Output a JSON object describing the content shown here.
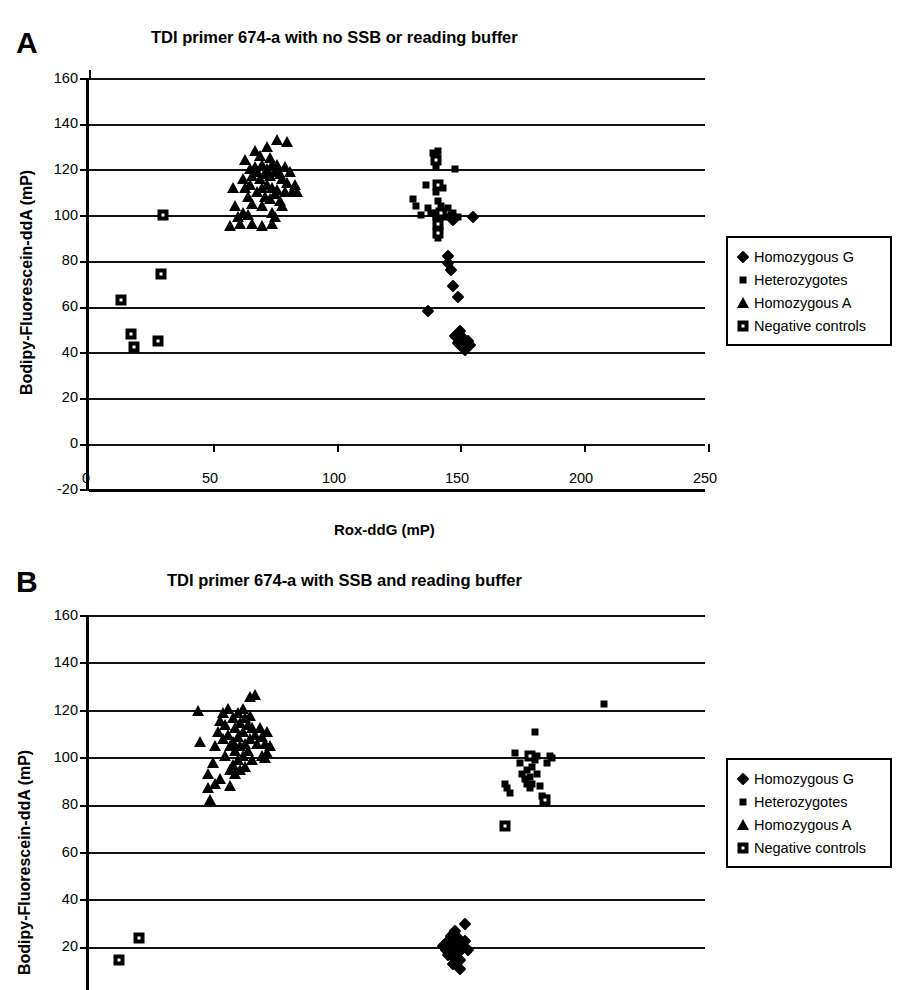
{
  "figure": {
    "panels": [
      {
        "letter": "A",
        "title": "TDI primer 674-a with no SSB or reading buffer",
        "xlabel": "Rox-ddG (mP)",
        "ylabel": "Bodipy-Fluorescein-ddA (mP)",
        "yticks": [
          "160",
          "140",
          "120",
          "100",
          "80",
          "60",
          "40",
          "20",
          "0",
          "-20"
        ],
        "xticks": [
          "0",
          "50",
          "100",
          "150",
          "200",
          "250"
        ]
      },
      {
        "letter": "B",
        "title": "TDI primer 674-a with SSB and reading buffer",
        "xlabel": "",
        "ylabel": "Bodipy-Fluorescein-ddA (mP)",
        "yticks": [
          "160",
          "140",
          "120",
          "100",
          "80",
          "60",
          "40",
          "20"
        ],
        "xticks": []
      }
    ],
    "legend": {
      "items": [
        {
          "label": "Homozygous G",
          "symbol": "diamond-marker"
        },
        {
          "label": "Heterozygotes",
          "symbol": "small-square-marker"
        },
        {
          "label": "Homozygous A",
          "symbol": "triangle-marker"
        },
        {
          "label": "Negative controls",
          "symbol": "dotted-square-marker"
        }
      ]
    },
    "colors": {
      "ink": "#000000",
      "background": "#ffffff"
    }
  },
  "chart_data": [
    {
      "type": "scatter",
      "panel": "A",
      "title": "TDI primer 674-a with no SSB or reading buffer",
      "xlabel": "Rox-ddG (mP)",
      "ylabel": "Bodipy-Fluorescein-ddA (mP)",
      "xlim": [
        0,
        250
      ],
      "ylim": [
        -20,
        160
      ],
      "grid": true,
      "legend_position": "right",
      "series": [
        {
          "name": "Homozygous A",
          "marker": "triangle",
          "points": [
            [
              59,
              104
            ],
            [
              60,
              99
            ],
            [
              61,
              96
            ],
            [
              62,
              116
            ],
            [
              63,
              112
            ],
            [
              63,
              124
            ],
            [
              64,
              108
            ],
            [
              64,
              100
            ],
            [
              65,
              120
            ],
            [
              65,
              113
            ],
            [
              66,
              117
            ],
            [
              66,
              105
            ],
            [
              67,
              128
            ],
            [
              67,
              121
            ],
            [
              68,
              119
            ],
            [
              68,
              110
            ],
            [
              69,
              126
            ],
            [
              69,
              116
            ],
            [
              70,
              122
            ],
            [
              70,
              112
            ],
            [
              70,
              104
            ],
            [
              71,
              118
            ],
            [
              71,
              108
            ],
            [
              72,
              130
            ],
            [
              72,
              120
            ],
            [
              72,
              113
            ],
            [
              73,
              125
            ],
            [
              73,
              117
            ],
            [
              73,
              107
            ],
            [
              74,
              122
            ],
            [
              74,
              112
            ],
            [
              74,
              101
            ],
            [
              75,
              119
            ],
            [
              75,
              109
            ],
            [
              75,
              99
            ],
            [
              76,
              133
            ],
            [
              76,
              122
            ],
            [
              76,
              111
            ],
            [
              77,
              118
            ],
            [
              77,
              106
            ],
            [
              78,
              116
            ],
            [
              78,
              104
            ],
            [
              79,
              121
            ],
            [
              79,
              110
            ],
            [
              80,
              132
            ],
            [
              80,
              114
            ],
            [
              81,
              119
            ],
            [
              82,
              110
            ],
            [
              83,
              113
            ],
            [
              84,
              110
            ],
            [
              57,
              95
            ],
            [
              58,
              112
            ],
            [
              62,
              101
            ],
            [
              66,
              96
            ],
            [
              70,
              95
            ],
            [
              74,
              96
            ]
          ]
        },
        {
          "name": "Heterozygotes",
          "marker": "small-square",
          "points": [
            [
              131,
              107
            ],
            [
              132,
              104
            ],
            [
              134,
              100
            ],
            [
              136,
              113
            ],
            [
              137,
              103
            ],
            [
              138,
              101
            ],
            [
              139,
              127
            ],
            [
              140,
              126
            ],
            [
              140,
              121
            ],
            [
              140,
              110
            ],
            [
              140,
              100
            ],
            [
              141,
              128
            ],
            [
              141,
              106
            ],
            [
              141,
              97
            ],
            [
              142,
              104
            ],
            [
              142,
              100
            ],
            [
              143,
              112
            ],
            [
              143,
              101
            ],
            [
              144,
              99
            ],
            [
              145,
              103
            ],
            [
              146,
              100
            ],
            [
              147,
              101
            ],
            [
              148,
              120
            ],
            [
              149,
              99
            ],
            [
              141,
              94
            ],
            [
              141,
              90
            ]
          ]
        },
        {
          "name": "Homozygous G",
          "marker": "diamond",
          "points": [
            [
              137,
              58
            ],
            [
              145,
              82
            ],
            [
              145,
              79
            ],
            [
              146,
              76
            ],
            [
              147,
              69
            ],
            [
              149,
              64
            ],
            [
              148,
              47
            ],
            [
              149,
              44
            ],
            [
              150,
              49
            ],
            [
              150,
              43
            ],
            [
              151,
              46
            ],
            [
              152,
              41
            ],
            [
              153,
              45
            ],
            [
              154,
              43
            ],
            [
              155,
              99
            ],
            [
              147,
              98
            ]
          ]
        },
        {
          "name": "Negative controls",
          "marker": "dotted-square",
          "points": [
            [
              13,
              63
            ],
            [
              17,
              48
            ],
            [
              18,
              42
            ],
            [
              28,
              45
            ],
            [
              29,
              74
            ],
            [
              30,
              100
            ],
            [
              140,
              124
            ],
            [
              141,
              113
            ],
            [
              141,
              100
            ],
            [
              141,
              96
            ],
            [
              141,
              92
            ],
            [
              142,
              101
            ]
          ]
        }
      ]
    },
    {
      "type": "scatter",
      "panel": "B",
      "title": "TDI primer 674-a with SSB and reading buffer",
      "xlabel": "",
      "ylabel": "Bodipy-Fluorescein-ddA (mP)",
      "xlim": [
        0,
        250
      ],
      "ylim": [
        0,
        160
      ],
      "grid": true,
      "legend_position": "right",
      "note": "lower portion of plot is cropped by image edge",
      "series": [
        {
          "name": "Homozygous A",
          "marker": "triangle",
          "points": [
            [
              44,
              119
            ],
            [
              45,
              106
            ],
            [
              48,
              92
            ],
            [
              48,
              86
            ],
            [
              49,
              81
            ],
            [
              50,
              97
            ],
            [
              51,
              104
            ],
            [
              52,
              110
            ],
            [
              53,
              115
            ],
            [
              54,
              118
            ],
            [
              54,
              107
            ],
            [
              55,
              113
            ],
            [
              55,
              100
            ],
            [
              56,
              120
            ],
            [
              56,
              109
            ],
            [
              57,
              104
            ],
            [
              57,
              94
            ],
            [
              58,
              116
            ],
            [
              58,
              106
            ],
            [
              58,
              96
            ],
            [
              59,
              112
            ],
            [
              59,
              102
            ],
            [
              59,
              92
            ],
            [
              60,
              118
            ],
            [
              60,
              108
            ],
            [
              60,
              98
            ],
            [
              61,
              114
            ],
            [
              61,
              104
            ],
            [
              61,
              94
            ],
            [
              62,
              120
            ],
            [
              62,
              110
            ],
            [
              62,
              100
            ],
            [
              63,
              116
            ],
            [
              63,
              105
            ],
            [
              63,
              95
            ],
            [
              64,
              113
            ],
            [
              64,
              102
            ],
            [
              65,
              125
            ],
            [
              65,
              117
            ],
            [
              65,
              107
            ],
            [
              66,
              112
            ],
            [
              66,
              98
            ],
            [
              67,
              126
            ],
            [
              67,
              109
            ],
            [
              68,
              105
            ],
            [
              69,
              112
            ],
            [
              70,
              108
            ],
            [
              70,
              100
            ],
            [
              71,
              105
            ],
            [
              71,
              99
            ],
            [
              72,
              110
            ],
            [
              72,
              101
            ],
            [
              73,
              104
            ],
            [
              51,
              88
            ],
            [
              53,
              90
            ],
            [
              57,
              87
            ]
          ]
        },
        {
          "name": "Heterozygotes",
          "marker": "small-square",
          "points": [
            [
              172,
              101
            ],
            [
              174,
              97
            ],
            [
              175,
              92
            ],
            [
              176,
              90
            ],
            [
              177,
              88
            ],
            [
              177,
              94
            ],
            [
              178,
              86
            ],
            [
              178,
              91
            ],
            [
              179,
              95
            ],
            [
              179,
              88
            ],
            [
              180,
              110
            ],
            [
              180,
              98
            ],
            [
              181,
              92
            ],
            [
              182,
              87
            ],
            [
              183,
              83
            ],
            [
              184,
              82
            ],
            [
              185,
              97
            ],
            [
              186,
              100
            ],
            [
              187,
              99
            ],
            [
              168,
              88
            ],
            [
              169,
              86
            ],
            [
              170,
              84
            ],
            [
              181,
              100
            ],
            [
              208,
              122
            ]
          ]
        },
        {
          "name": "Homozygous G",
          "marker": "diamond",
          "points": [
            [
              143,
              19
            ],
            [
              144,
              17
            ],
            [
              145,
              21
            ],
            [
              145,
              15
            ],
            [
              146,
              23
            ],
            [
              146,
              18
            ],
            [
              147,
              20
            ],
            [
              147,
              14
            ],
            [
              148,
              25
            ],
            [
              148,
              19
            ],
            [
              149,
              16
            ],
            [
              149,
              22
            ],
            [
              150,
              20
            ],
            [
              150,
              13
            ],
            [
              151,
              18
            ],
            [
              152,
              28
            ],
            [
              152,
              21
            ],
            [
              153,
              17
            ],
            [
              147,
              11
            ],
            [
              150,
              9
            ]
          ]
        },
        {
          "name": "Negative controls",
          "marker": "dotted-square",
          "points": [
            [
              12,
              13
            ],
            [
              20,
              22
            ],
            [
              168,
              70
            ],
            [
              178,
              100
            ],
            [
              184,
              81
            ]
          ]
        }
      ]
    }
  ]
}
